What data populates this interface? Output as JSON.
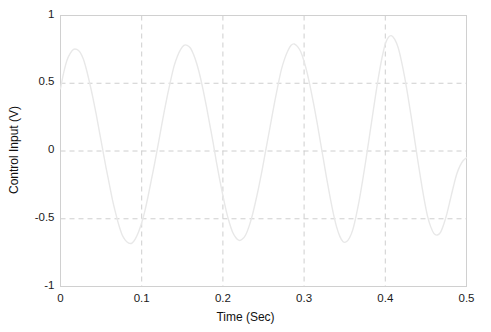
{
  "chart_data": {
    "type": "line",
    "title": "",
    "xlabel": "Time (Sec)",
    "ylabel": "Control Input (V)",
    "xlim": [
      0,
      0.5
    ],
    "ylim": [
      -1,
      1
    ],
    "xticks": [
      "0",
      "0.1",
      "0.2",
      "0.3",
      "0.4",
      "0.5"
    ],
    "xtick_values": [
      0,
      0.1,
      0.2,
      0.3,
      0.4,
      0.5
    ],
    "yticks": [
      "-1",
      "-0.5",
      "0",
      "0.5",
      "1"
    ],
    "ytick_values": [
      -1,
      -0.5,
      0,
      0.5,
      1
    ],
    "grid": true,
    "grid_style": "dashed",
    "legend": null,
    "series": [
      {
        "name": "Control Input",
        "color": "#e8e8e8",
        "line_width": 1.4,
        "x": [
          0.0,
          0.004,
          0.008,
          0.012,
          0.016,
          0.02,
          0.024,
          0.028,
          0.032,
          0.036,
          0.04,
          0.044,
          0.048,
          0.052,
          0.056,
          0.06,
          0.064,
          0.068,
          0.072,
          0.076,
          0.08,
          0.084,
          0.088,
          0.092,
          0.096,
          0.1,
          0.104,
          0.108,
          0.112,
          0.116,
          0.12,
          0.124,
          0.128,
          0.132,
          0.136,
          0.14,
          0.144,
          0.148,
          0.152,
          0.156,
          0.16,
          0.164,
          0.168,
          0.172,
          0.176,
          0.18,
          0.184,
          0.188,
          0.192,
          0.196,
          0.2,
          0.204,
          0.208,
          0.212,
          0.216,
          0.22,
          0.224,
          0.228,
          0.232,
          0.236,
          0.24,
          0.244,
          0.248,
          0.252,
          0.256,
          0.26,
          0.264,
          0.268,
          0.272,
          0.276,
          0.28,
          0.284,
          0.288,
          0.292,
          0.296,
          0.3,
          0.304,
          0.308,
          0.312,
          0.316,
          0.32,
          0.324,
          0.328,
          0.332,
          0.336,
          0.34,
          0.344,
          0.348,
          0.352,
          0.356,
          0.36,
          0.364,
          0.368,
          0.372,
          0.376,
          0.38,
          0.384,
          0.388,
          0.392,
          0.396,
          0.4,
          0.404,
          0.408,
          0.412,
          0.416,
          0.42,
          0.424,
          0.428,
          0.432,
          0.436,
          0.44,
          0.444,
          0.448,
          0.452,
          0.456,
          0.46,
          0.464,
          0.468,
          0.472,
          0.476,
          0.48,
          0.484,
          0.488,
          0.492,
          0.496,
          0.5
        ],
        "y": [
          0.46,
          0.58,
          0.67,
          0.72,
          0.75,
          0.75,
          0.73,
          0.68,
          0.6,
          0.5,
          0.39,
          0.27,
          0.14,
          0.01,
          -0.12,
          -0.24,
          -0.36,
          -0.46,
          -0.55,
          -0.62,
          -0.66,
          -0.68,
          -0.68,
          -0.65,
          -0.6,
          -0.53,
          -0.44,
          -0.33,
          -0.21,
          -0.09,
          0.04,
          0.17,
          0.3,
          0.42,
          0.53,
          0.63,
          0.7,
          0.75,
          0.78,
          0.78,
          0.76,
          0.71,
          0.64,
          0.55,
          0.44,
          0.32,
          0.19,
          0.06,
          -0.08,
          -0.21,
          -0.33,
          -0.44,
          -0.53,
          -0.6,
          -0.64,
          -0.66,
          -0.65,
          -0.62,
          -0.56,
          -0.48,
          -0.38,
          -0.27,
          -0.15,
          -0.02,
          0.11,
          0.24,
          0.37,
          0.49,
          0.6,
          0.68,
          0.74,
          0.78,
          0.79,
          0.77,
          0.73,
          0.66,
          0.57,
          0.46,
          0.34,
          0.21,
          0.07,
          -0.07,
          -0.21,
          -0.34,
          -0.46,
          -0.56,
          -0.63,
          -0.67,
          -0.67,
          -0.64,
          -0.58,
          -0.48,
          -0.36,
          -0.22,
          -0.07,
          0.09,
          0.25,
          0.41,
          0.56,
          0.69,
          0.79,
          0.84,
          0.85,
          0.82,
          0.76,
          0.66,
          0.54,
          0.4,
          0.25,
          0.09,
          -0.07,
          -0.22,
          -0.36,
          -0.48,
          -0.56,
          -0.61,
          -0.62,
          -0.6,
          -0.54,
          -0.46,
          -0.36,
          -0.26,
          -0.17,
          -0.11,
          -0.07,
          -0.05
        ]
      }
    ]
  },
  "axes": {
    "frame_color": "#d0d0d0",
    "grid_color": "#c8c8c8",
    "background": "#ffffff",
    "text_color": "#1a1a1a"
  }
}
